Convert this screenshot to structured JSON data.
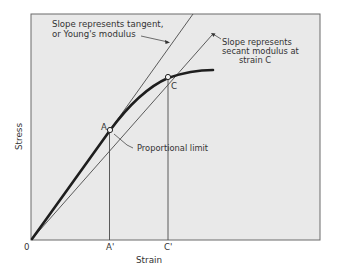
{
  "diagram": {
    "type": "stress-strain curve",
    "axes": {
      "x_label": "Strain",
      "y_label": "Stress",
      "origin_label": "0"
    },
    "points": {
      "A": {
        "label": "A",
        "tick_label": "A'"
      },
      "C": {
        "label": "C",
        "tick_label": "C'"
      }
    },
    "annotations": {
      "tangent_line1": "Slope represents tangent,",
      "tangent_line2": "or Young's modulus",
      "secant_line1": "Slope represents",
      "secant_line2": "secant modulus at",
      "secant_line3": "strain C",
      "proportional_limit": "Proportional limit"
    },
    "colors": {
      "plot_background": "#e9e9e9",
      "frame": "#6a6a6a",
      "curve": "#1e1e1e",
      "lines": "#4a4a4a",
      "text": "#333333"
    }
  }
}
